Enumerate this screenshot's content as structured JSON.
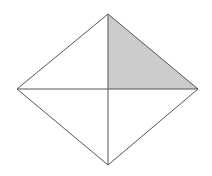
{
  "figure": {
    "name": "rhombus-with-shaded-quadrant",
    "background_color": "#ffffff",
    "canvas": {
      "width": 212,
      "height": 176
    },
    "stroke_color": "#555555",
    "stroke_width": 1,
    "shaded_fill_color": "#cccccc",
    "unshaded_fill_color": "#ffffff",
    "vertices": {
      "top": {
        "x": 108,
        "y": 14
      },
      "left": {
        "x": 17,
        "y": 89
      },
      "right": {
        "x": 198,
        "y": 89
      },
      "bottom": {
        "x": 108,
        "y": 165
      },
      "center": {
        "x": 108,
        "y": 89
      }
    },
    "outline_path": "M 108 14 L 198 89 L 108 165 L 17 89 Z",
    "diagonal_horizontal_path": "M 17 89 L 198 89",
    "diagonal_vertical_path": "M 108 14 L 108 165",
    "shaded_triangle_path": "M 108 14 L 198 89 L 108 89 Z",
    "regions": [
      {
        "name": "top-left-quadrant",
        "shaded": false,
        "fill": "#ffffff"
      },
      {
        "name": "top-right-quadrant",
        "shaded": true,
        "fill": "#cccccc"
      },
      {
        "name": "bottom-right-quadrant",
        "shaded": false,
        "fill": "#ffffff"
      },
      {
        "name": "bottom-left-quadrant",
        "shaded": false,
        "fill": "#ffffff"
      }
    ]
  }
}
